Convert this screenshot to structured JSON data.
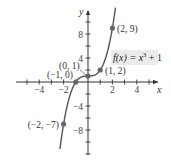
{
  "chart_data": {
    "type": "line",
    "title": "",
    "function_label": "f(x) = x³ + 1",
    "function_label_parts": {
      "lhs": "f(x) = x",
      "exp": "3",
      "rhs": " + 1"
    },
    "xlabel": "x",
    "ylabel": "y",
    "xlim": [
      -5.5,
      5.5
    ],
    "ylim": [
      -12,
      12
    ],
    "x_ticks": [
      -5,
      -4,
      -3,
      -2,
      -1,
      1,
      2,
      3,
      4,
      5
    ],
    "x_tick_labels": [
      {
        "value": -4,
        "label": "−4"
      },
      {
        "value": -2,
        "label": "−2"
      },
      {
        "value": 2,
        "label": "2"
      },
      {
        "value": 4,
        "label": "4"
      }
    ],
    "y_ticks": [
      -12,
      -10,
      -8,
      -6,
      -4,
      -2,
      2,
      4,
      6,
      8,
      10
    ],
    "y_tick_labels": [
      {
        "value": 8,
        "label": "8"
      },
      {
        "value": 4,
        "label": "4"
      },
      {
        "value": -4,
        "label": "−4"
      },
      {
        "value": -8,
        "label": "−8"
      }
    ],
    "grid": false,
    "curve": {
      "expression": "x^3 + 1",
      "x_range": [
        -2.3,
        2.25
      ],
      "color": "#555555"
    },
    "points": [
      {
        "x": -2,
        "y": -7,
        "label": "(−2, −7)"
      },
      {
        "x": -1,
        "y": 0,
        "label": "(−1, 0)"
      },
      {
        "x": 0,
        "y": 1,
        "label": "(0, 1)"
      },
      {
        "x": 1,
        "y": 2,
        "label": "(1, 2)"
      },
      {
        "x": 2,
        "y": 9,
        "label": "(2, 9)"
      }
    ],
    "colors": {
      "axis": "#333333",
      "curve": "#555555",
      "point": "#666666",
      "label_box": "#ebebeb"
    }
  }
}
